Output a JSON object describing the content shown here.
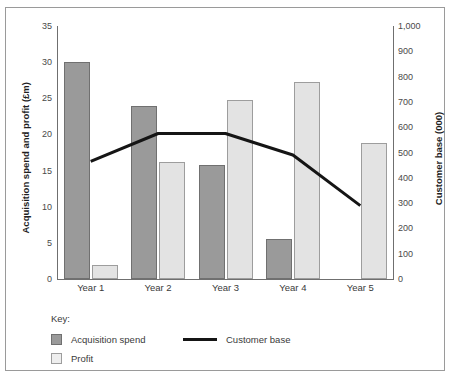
{
  "chart_data": {
    "type": "bar",
    "title": "",
    "subtitle": "",
    "xlabel": "",
    "categories": [
      "Year 1",
      "Year 2",
      "Year 3",
      "Year 4",
      "Year 5"
    ],
    "grid": false,
    "legend_position": "bottom-left",
    "legend_title": "Key:",
    "series": [
      {
        "name": "Acquisition spend",
        "type": "bar",
        "axis": "left",
        "color": "#9a9a9a",
        "values": [
          30,
          24,
          15.8,
          5.5,
          0
        ]
      },
      {
        "name": "Profit",
        "type": "bar",
        "axis": "left",
        "color": "#e3e3e3",
        "values": [
          2,
          16.2,
          24.7,
          27.2,
          18.8
        ]
      },
      {
        "name": "Customer base",
        "type": "line",
        "axis": "right",
        "color": "#151515",
        "values": [
          465,
          575,
          575,
          490,
          290
        ]
      }
    ],
    "axes": {
      "left": {
        "label": "Acquisition spend and profit (£m)",
        "min": 0,
        "max": 35,
        "step": 5,
        "ticks": [
          "0",
          "5",
          "10",
          "15",
          "20",
          "25",
          "30",
          "35"
        ]
      },
      "right": {
        "label": "Customer base (000)",
        "min": 0,
        "max": 1000,
        "step": 100,
        "ticks": [
          "0",
          "100",
          "200",
          "300",
          "400",
          "500",
          "600",
          "700",
          "800",
          "900",
          "1,000"
        ]
      }
    }
  },
  "legend": {
    "title": "Key:",
    "items": [
      {
        "label": "Acquisition spend",
        "marker": "square-dark"
      },
      {
        "label": "Profit",
        "marker": "square-light"
      },
      {
        "label": "Customer base",
        "marker": "line-black"
      }
    ]
  },
  "colors": {
    "spend": "#9a9a9a",
    "profit": "#e3e3e3",
    "line": "#151515",
    "axis": "#6f6f6f",
    "border": "#9a9a9a",
    "background": "#ffffff"
  }
}
